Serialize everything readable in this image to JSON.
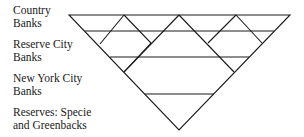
{
  "labels": [
    {
      "line1": "Country",
      "line2": "Banks"
    },
    {
      "line1": "Reserve City",
      "line2": "Banks"
    },
    {
      "line1": "New York City",
      "line2": "Banks"
    },
    {
      "line1": "Reserves: Specie",
      "line2": "and Greenbacks"
    }
  ],
  "diagram": {
    "shape": "inverted-pyramid",
    "line_color": "#1a1a1a",
    "tiers": [
      "Country Banks",
      "Reserve City Banks",
      "New York City Banks",
      "Reserves: Specie and Greenbacks"
    ]
  }
}
